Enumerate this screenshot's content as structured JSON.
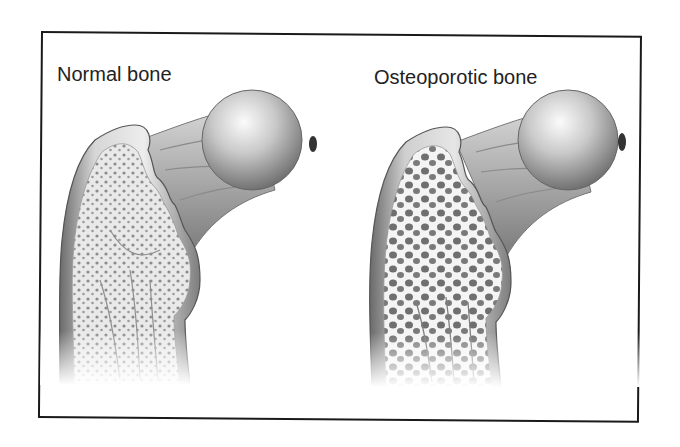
{
  "figure": {
    "panels": [
      {
        "id": "normal",
        "label": "Normal bone",
        "trabecular_pattern": "dense"
      },
      {
        "id": "osteoporotic",
        "label": "Osteoporotic bone",
        "trabecular_pattern": "porous"
      }
    ]
  },
  "colors": {
    "frame_border": "#1a1a1a",
    "text": "#222222",
    "bone_light": "#f2f2f2",
    "bone_mid": "#a8a8a8",
    "bone_dark": "#5a5a5a"
  }
}
